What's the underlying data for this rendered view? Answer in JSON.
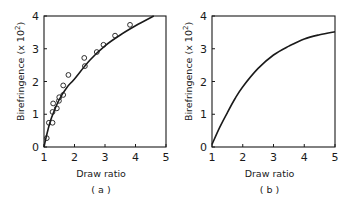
{
  "figure": {
    "background": "#ffffff",
    "ink": "#1a1a1a"
  },
  "chart_data": [
    {
      "type": "scatter",
      "panel_label": "( a )",
      "title": "",
      "xlabel": "Draw ratio",
      "ylabel": "Birefringence (x 10",
      "ylabel_exponent": "2",
      "ylabel_close": ")",
      "xlim": [
        1,
        5
      ],
      "ylim": [
        0,
        4
      ],
      "xticks": [
        "1",
        "2",
        "3",
        "4",
        "5"
      ],
      "yticks": [
        "0",
        "1",
        "2",
        "3",
        "4"
      ],
      "grid": false,
      "legend": null,
      "series": [
        {
          "name": "measured",
          "marker": "open-circle",
          "x": [
            1.09,
            1.16,
            1.28,
            1.28,
            1.3,
            1.42,
            1.49,
            1.5,
            1.63,
            1.63,
            1.8,
            2.32,
            2.34,
            2.73,
            2.95,
            3.33,
            3.82
          ],
          "y": [
            0.27,
            0.74,
            0.74,
            1.07,
            1.33,
            1.18,
            1.41,
            1.52,
            1.59,
            1.88,
            2.2,
            2.72,
            2.47,
            2.9,
            3.12,
            3.4,
            3.73
          ]
        },
        {
          "name": "fit",
          "line": "solid",
          "x": [
            1.0,
            1.1,
            1.25,
            1.5,
            1.75,
            2.0,
            2.5,
            3.0,
            3.5,
            4.0,
            4.6
          ],
          "y": [
            0.0,
            0.42,
            0.9,
            1.45,
            1.82,
            2.08,
            2.65,
            3.09,
            3.42,
            3.7,
            4.0
          ]
        }
      ]
    },
    {
      "type": "line",
      "panel_label": "( b )",
      "title": "",
      "xlabel": "Draw ratio",
      "ylabel": "Birefringence (x 10",
      "ylabel_exponent": "2",
      "ylabel_close": ")",
      "xlim": [
        1,
        5
      ],
      "ylim": [
        0,
        4
      ],
      "xticks": [
        "1",
        "2",
        "3",
        "4",
        "5"
      ],
      "yticks": [
        "0",
        "1",
        "2",
        "3",
        "4"
      ],
      "grid": false,
      "legend": null,
      "series": [
        {
          "name": "calculated",
          "line": "solid",
          "x": [
            1.0,
            1.25,
            1.5,
            1.75,
            2.0,
            2.5,
            3.0,
            3.5,
            4.0,
            4.5,
            5.0
          ],
          "y": [
            0.08,
            0.6,
            1.05,
            1.48,
            1.84,
            2.4,
            2.81,
            3.08,
            3.3,
            3.43,
            3.52
          ]
        }
      ]
    }
  ]
}
